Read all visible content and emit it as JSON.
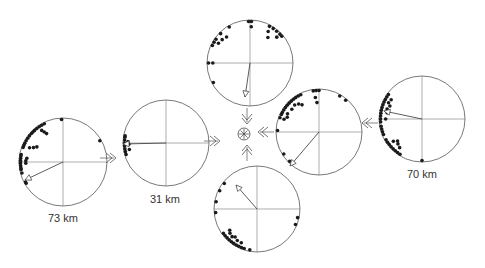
{
  "figure": {
    "type": "circular rose plots with mean vectors converging on a center point",
    "center_symbol": "asterisk-in-circle",
    "plots": [
      {
        "id": "left-far",
        "cx": 63,
        "cy": 162,
        "r": 44,
        "label": "73 km",
        "vector": {
          "dx": -38,
          "dy": 18
        },
        "dots": [
          [
            150,
            1
          ],
          [
            152,
            1
          ],
          [
            165,
            1
          ],
          [
            170,
            1
          ],
          [
            172,
            1
          ],
          [
            175,
            1
          ],
          [
            178,
            1
          ],
          [
            180,
            1
          ],
          [
            182,
            1
          ],
          [
            185,
            1
          ],
          [
            188,
            1
          ],
          [
            190,
            1
          ],
          [
            200,
            1
          ],
          [
            203,
            1
          ],
          [
            206,
            1
          ],
          [
            210,
            1
          ],
          [
            214,
            1
          ],
          [
            218,
            1
          ],
          [
            222,
            1
          ],
          [
            225,
            1
          ],
          [
            228,
            1
          ],
          [
            232,
            1
          ],
          [
            236,
            1
          ],
          [
            240,
            1
          ],
          [
            244,
            1
          ],
          [
            268,
            1
          ],
          [
            330,
            1
          ]
        ],
        "inner_dots": [
          [
            178,
            0.88
          ],
          [
            182,
            0.88
          ],
          [
            186,
            0.86
          ],
          [
            203,
            0.86
          ],
          [
            206,
            0.78
          ],
          [
            210,
            0.72
          ],
          [
            236,
            0.9
          ],
          [
            238,
            0.84
          ],
          [
            240,
            0.78
          ]
        ],
        "arrow_to": "right"
      },
      {
        "id": "left-near",
        "cx": 166,
        "cy": 143,
        "r": 43,
        "label": "31 km",
        "vector": {
          "dx": -43,
          "dy": 1
        },
        "dots": [
          [
            164,
            1
          ],
          [
            168,
            1
          ],
          [
            172,
            1
          ],
          [
            176,
            1
          ],
          [
            180,
            1
          ],
          [
            184,
            1
          ],
          [
            188,
            1
          ],
          [
            190,
            1
          ]
        ],
        "inner_dots": [
          [
            170,
            0.9
          ],
          [
            178,
            0.9
          ],
          [
            182,
            0.92
          ]
        ],
        "arrow_to": "right"
      },
      {
        "id": "top",
        "cx": 250,
        "cy": 63,
        "r": 43,
        "label": "",
        "vector": {
          "dx": -5,
          "dy": 34
        },
        "dots": [
          [
            152,
            1
          ],
          [
            180,
            1
          ],
          [
            205,
            1
          ],
          [
            210,
            1
          ],
          [
            215,
            1
          ],
          [
            225,
            1
          ],
          [
            240,
            1
          ],
          [
            268,
            1
          ],
          [
            272,
            1
          ],
          [
            298,
            1
          ],
          [
            304,
            1
          ],
          [
            310,
            1
          ],
          [
            316,
            1
          ],
          [
            320,
            1
          ]
        ],
        "inner_dots": [
          [
            180,
            0.9
          ],
          [
            212,
            0.9
          ],
          [
            220,
            0.88
          ],
          [
            228,
            0.85
          ],
          [
            272,
            0.88
          ],
          [
            300,
            0.88
          ],
          [
            305,
            0.76
          ],
          [
            316,
            0.9
          ]
        ],
        "arrow_to": "down"
      },
      {
        "id": "right-near",
        "cx": 319,
        "cy": 132,
        "r": 43,
        "label": "",
        "vector": {
          "dx": -29,
          "dy": 34
        },
        "dots": [
          [
            135,
            1
          ],
          [
            148,
            1
          ],
          [
            182,
            1
          ],
          [
            200,
            1
          ],
          [
            205,
            1
          ],
          [
            208,
            1
          ],
          [
            212,
            1
          ],
          [
            216,
            1
          ],
          [
            220,
            1
          ],
          [
            224,
            1
          ],
          [
            228,
            1
          ],
          [
            232,
            1
          ],
          [
            236,
            1
          ],
          [
            240,
            1
          ],
          [
            244,
            1
          ],
          [
            262,
            1
          ],
          [
            266,
            1
          ],
          [
            270,
            1
          ],
          [
            300,
            1
          ],
          [
            310,
            1
          ]
        ],
        "inner_dots": [
          [
            200,
            0.9
          ],
          [
            205,
            0.85
          ],
          [
            210,
            0.88
          ],
          [
            220,
            0.86
          ],
          [
            228,
            0.88
          ],
          [
            234,
            0.84
          ],
          [
            238,
            0.78
          ],
          [
            264,
            0.84
          ],
          [
            266,
            0.72
          ]
        ],
        "arrow_to": "left"
      },
      {
        "id": "right-far",
        "cx": 422,
        "cy": 119,
        "r": 43,
        "label": "70 km",
        "vector": {
          "dx": -38,
          "dy": -8
        },
        "dots": [
          [
            90,
            1
          ],
          [
            122,
            1
          ],
          [
            126,
            1
          ],
          [
            130,
            1
          ],
          [
            134,
            1
          ],
          [
            138,
            1
          ],
          [
            142,
            1
          ],
          [
            146,
            1
          ],
          [
            150,
            1
          ],
          [
            158,
            1
          ],
          [
            162,
            1
          ],
          [
            166,
            1
          ],
          [
            170,
            1
          ],
          [
            176,
            1
          ],
          [
            180,
            1
          ],
          [
            184,
            1
          ],
          [
            188,
            1
          ],
          [
            192,
            1
          ],
          [
            196,
            1
          ],
          [
            200,
            1
          ],
          [
            204,
            1
          ],
          [
            208,
            1
          ],
          [
            212,
            1
          ],
          [
            216,
            1
          ]
        ],
        "inner_dots": [
          [
            128,
            0.88
          ],
          [
            134,
            0.84
          ],
          [
            138,
            0.8
          ],
          [
            142,
            0.88
          ],
          [
            180,
            0.88
          ],
          [
            190,
            0.86
          ],
          [
            196,
            0.88
          ],
          [
            202,
            0.84
          ],
          [
            206,
            0.9
          ],
          [
            212,
            0.88
          ]
        ],
        "arrow_to": "left"
      },
      {
        "id": "bottom",
        "cx": 257,
        "cy": 209,
        "r": 43,
        "label": "",
        "vector": {
          "dx": -21,
          "dy": -24
        },
        "dots": [
          [
            22,
            1
          ],
          [
            12,
            1
          ],
          [
            100,
            1
          ],
          [
            108,
            1
          ],
          [
            112,
            1
          ],
          [
            116,
            1
          ],
          [
            120,
            1
          ],
          [
            124,
            1
          ],
          [
            128,
            1
          ],
          [
            132,
            1
          ],
          [
            136,
            1
          ],
          [
            140,
            1
          ],
          [
            144,
            1
          ],
          [
            175,
            1
          ],
          [
            190,
            1
          ],
          [
            206,
            1
          ],
          [
            218,
            1
          ]
        ],
        "inner_dots": [
          [
            115,
            0.9
          ],
          [
            122,
            0.9
          ],
          [
            128,
            0.86
          ],
          [
            132,
            0.9
          ],
          [
            138,
            0.88
          ],
          [
            142,
            0.84
          ]
        ],
        "arrow_to": "up"
      }
    ],
    "connector_arrows": [
      {
        "x": 108,
        "y": 158,
        "dir": "right"
      },
      {
        "x": 212,
        "y": 141,
        "dir": "right"
      },
      {
        "x": 247,
        "y": 116,
        "dir": "down"
      },
      {
        "x": 247,
        "y": 153,
        "dir": "up"
      },
      {
        "x": 266,
        "y": 132,
        "dir": "left"
      },
      {
        "x": 370,
        "y": 123,
        "dir": "left"
      }
    ],
    "center": {
      "x": 244,
      "y": 134
    }
  },
  "labels": {
    "left_far": "73 km",
    "left_near": "31 km",
    "right_far": "70 km"
  }
}
